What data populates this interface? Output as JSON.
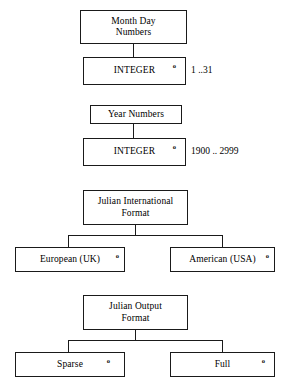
{
  "diagram": {
    "type": "data-type-definition-tree",
    "marker_glyph": "o",
    "line_color": "#1a1a1a",
    "background_color": "#ffffff",
    "groups": [
      {
        "id": "month-day-numbers",
        "parent": {
          "label": "Month Day\nNumbers"
        },
        "child": {
          "label": "INTEGER",
          "marker": "o"
        },
        "annotation": "1 ..31"
      },
      {
        "id": "year-numbers",
        "parent": {
          "label": "Year Numbers"
        },
        "child": {
          "label": "INTEGER",
          "marker": "o"
        },
        "annotation": "1900 .. 2999"
      },
      {
        "id": "julian-international-format",
        "parent": {
          "label": "Julian International\nFormat"
        },
        "children": [
          {
            "label": "European (UK)",
            "marker": "o"
          },
          {
            "label": "American (USA)",
            "marker": "o"
          }
        ]
      },
      {
        "id": "julian-output-format",
        "parent": {
          "label": "Julian Output\nFormat"
        },
        "children": [
          {
            "label": "Sparse",
            "marker": "o"
          },
          {
            "label": "Full",
            "marker": "o"
          }
        ]
      }
    ]
  }
}
